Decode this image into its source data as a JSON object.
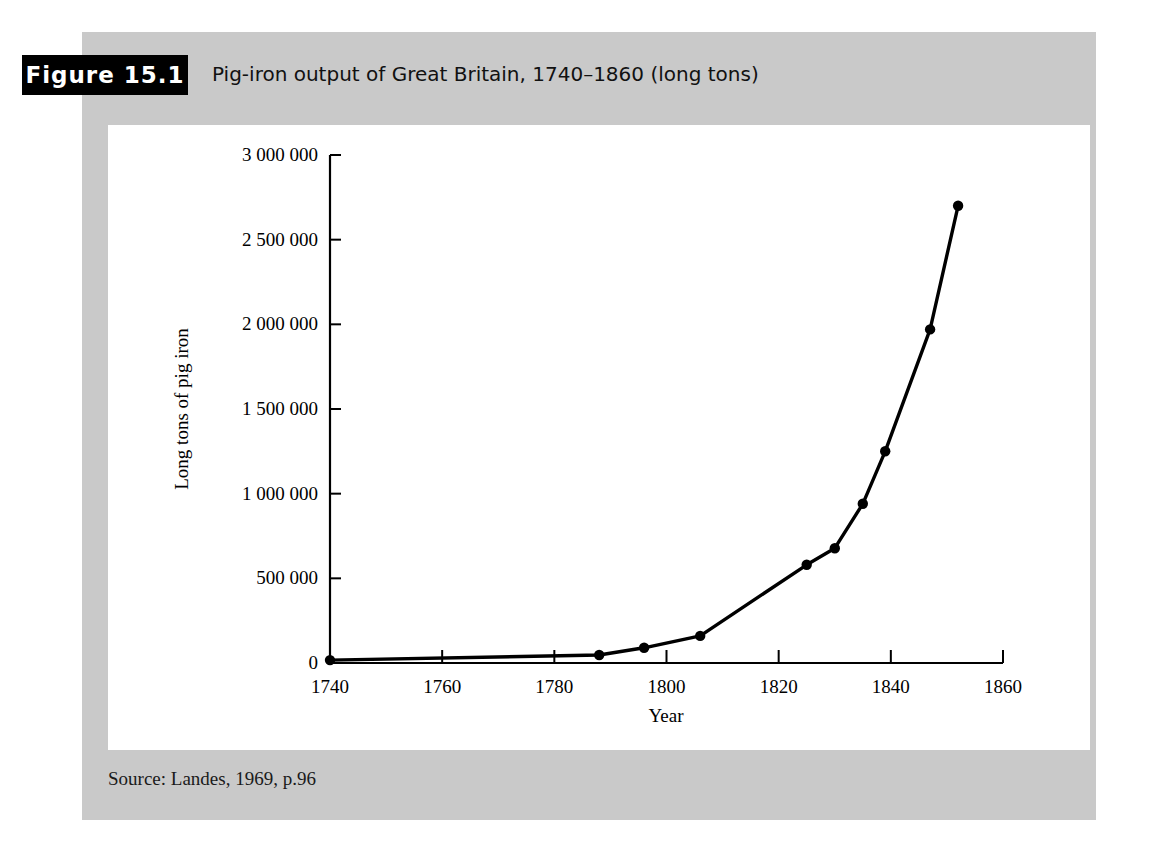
{
  "figure": {
    "badge_label": "Figure 15.1",
    "caption": "Pig-iron output of Great Britain, 1740–1860 (long tons)",
    "source_note": "Source: Landes, 1969, p.96"
  },
  "colors": {
    "panel_background": "#c9c9c9",
    "plot_background": "#ffffff",
    "badge_background": "#000000",
    "badge_text": "#ffffff",
    "line": "#000000",
    "axis": "#000000"
  },
  "chart_data": {
    "type": "line",
    "title": "Pig-iron output of Great Britain, 1740–1860 (long tons)",
    "xlabel": "Year",
    "ylabel": "Long tons of pig iron",
    "xlim": [
      1740,
      1860
    ],
    "ylim": [
      0,
      3000000
    ],
    "grid": false,
    "legend": "none",
    "xticks": [
      1740,
      1760,
      1780,
      1800,
      1820,
      1840,
      1860
    ],
    "xtick_labels": [
      "1740",
      "1760",
      "1780",
      "1800",
      "1820",
      "1840",
      "1860"
    ],
    "yticks": [
      0,
      500000,
      1000000,
      1500000,
      2000000,
      2500000,
      3000000
    ],
    "ytick_labels": [
      "0",
      "500 000",
      "1 000 000",
      "1 500 000",
      "2 000 000",
      "2 500 000",
      "3 000 000"
    ],
    "series": [
      {
        "name": "Pig-iron output",
        "marker": "circle",
        "x": [
          1740,
          1788,
          1796,
          1806,
          1825,
          1830,
          1835,
          1839,
          1847,
          1852
        ],
        "values": [
          17000,
          47000,
          90000,
          160000,
          580000,
          678000,
          940000,
          1250000,
          1970000,
          2700000
        ]
      }
    ]
  }
}
